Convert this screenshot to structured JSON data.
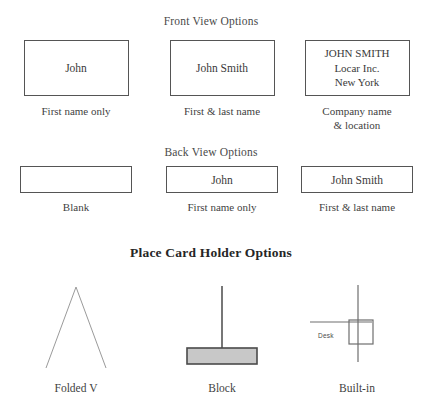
{
  "document": {
    "sections": {
      "front": {
        "heading": "Front View Options",
        "cards": [
          {
            "lines": [
              "John"
            ],
            "caption": "First name only"
          },
          {
            "lines": [
              "John Smith"
            ],
            "caption": "First & last name"
          },
          {
            "lines": [
              "JOHN SMITH",
              "Locar Inc.",
              "New York"
            ],
            "caption": "Company name\n& location"
          }
        ]
      },
      "back": {
        "heading": "Back View Options",
        "cards": [
          {
            "lines": [
              ""
            ],
            "caption": "Blank"
          },
          {
            "lines": [
              "John"
            ],
            "caption": "First name only"
          },
          {
            "lines": [
              "John Smith"
            ],
            "caption": "First & last name"
          }
        ]
      },
      "holders": {
        "title": "Place Card Holder Options",
        "items": [
          {
            "caption": "Folded V",
            "shape": "tent-triangle"
          },
          {
            "caption": "Block",
            "shape": "post-on-block"
          },
          {
            "caption": "Built-in",
            "shape": "desk-slot",
            "desk_label": "Desk"
          }
        ]
      }
    }
  },
  "front_card_1_line_1": "John",
  "front_card_2_line_1": "John Smith",
  "front_card_3_line_1": "JOHN SMITH",
  "front_card_3_line_2": "Locar Inc.",
  "front_card_3_line_3": "New York",
  "front_caption_1": "First name only",
  "front_caption_2": "First & last name",
  "front_caption_3_line_1": "Company name",
  "front_caption_3_line_2": "& location",
  "back_card_2_line_1": "John",
  "back_card_3_line_1": "John Smith",
  "back_caption_1": "Blank",
  "back_caption_2": "First name only",
  "back_caption_3": "First & last name",
  "holder_caption_1": "Folded V",
  "holder_caption_2": "Block",
  "holder_caption_3": "Built-in",
  "desk_label": "Desk",
  "colors": {
    "ink": "#3b3b3b",
    "card_border": "#555555",
    "block_fill": "#c8c8c8",
    "block_border": "#4a4a4a",
    "line": "#8c8c8c",
    "page_background": "#ffffff"
  }
}
